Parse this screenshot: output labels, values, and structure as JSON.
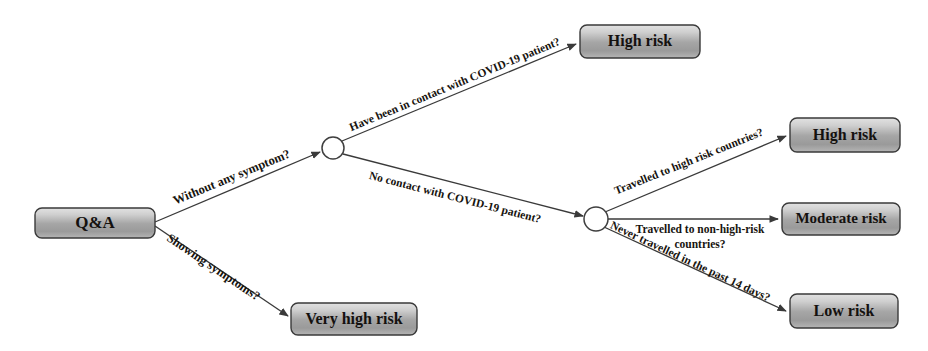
{
  "diagram": {
    "type": "decision-tree",
    "colors": {
      "box_fill_light": "#dcdcdc",
      "box_fill_mid": "#a9a9a9",
      "box_fill_dark": "#8f8f8f",
      "box_stroke": "#3a3a3a",
      "edge_stroke": "#3a3a3a",
      "text": "#14110f",
      "circle_fill": "#ffffff",
      "background": "#ffffff"
    },
    "nodes": [
      {
        "id": "root",
        "kind": "box",
        "label": "Q&A",
        "x": 35,
        "y": 208,
        "w": 120,
        "h": 30,
        "font_size": 17
      },
      {
        "id": "decision1",
        "kind": "circle",
        "label": "",
        "cx": 333,
        "cy": 148,
        "r": 11
      },
      {
        "id": "decision2",
        "kind": "circle",
        "label": "",
        "cx": 596,
        "cy": 219,
        "r": 12
      },
      {
        "id": "high-risk-contact",
        "kind": "box",
        "label": "High risk",
        "x": 580,
        "y": 25,
        "w": 120,
        "h": 33,
        "font_size": 16
      },
      {
        "id": "very-high-risk",
        "kind": "box",
        "label": "Very high risk",
        "x": 291,
        "y": 303,
        "w": 126,
        "h": 32,
        "font_size": 16
      },
      {
        "id": "high-risk-travel",
        "kind": "box",
        "label": "High risk",
        "x": 790,
        "y": 118,
        "w": 110,
        "h": 34,
        "font_size": 16
      },
      {
        "id": "moderate-risk",
        "kind": "box",
        "label": "Moderate risk",
        "x": 782,
        "y": 203,
        "w": 118,
        "h": 32,
        "font_size": 15
      },
      {
        "id": "low-risk",
        "kind": "box",
        "label": "Low risk",
        "x": 790,
        "y": 294,
        "w": 108,
        "h": 34,
        "font_size": 16
      }
    ],
    "edges": [
      {
        "id": "edge-without-symptom",
        "from": "root",
        "to": "decision1",
        "label": "Without any symptom?",
        "x1": 155,
        "y1": 222,
        "x2": 320,
        "y2": 152,
        "label_x": 232,
        "label_y": 178,
        "label_rotate": -22.5,
        "font_size": 12.5,
        "arrow": true
      },
      {
        "id": "edge-showing-symptoms",
        "from": "root",
        "to": "very-high-risk",
        "label": "Showing symptoms?",
        "x1": 155,
        "y1": 226,
        "x2": 288,
        "y2": 316,
        "label_x": 213,
        "label_y": 268,
        "label_rotate": 34,
        "font_size": 12.5,
        "arrow": true
      },
      {
        "id": "edge-contact-covid",
        "from": "decision1",
        "to": "high-risk-contact",
        "label": "Have been in contact with COVID-19 patient?",
        "x1": 342,
        "y1": 141,
        "x2": 576,
        "y2": 44,
        "label_x": 455,
        "label_y": 85,
        "label_rotate": -22.5,
        "font_size": 11.5,
        "arrow": true
      },
      {
        "id": "edge-no-contact-covid",
        "from": "decision1",
        "to": "decision2",
        "label": "No contact with COVID-19 patient?",
        "x1": 343,
        "y1": 154,
        "x2": 583,
        "y2": 216,
        "label_x": 455,
        "label_y": 198,
        "label_rotate": 14.5,
        "font_size": 11.5,
        "arrow": true
      },
      {
        "id": "edge-travelled-high-risk",
        "from": "decision2",
        "to": "high-risk-travel",
        "label": "Travelled to high risk countries?",
        "x1": 605,
        "y1": 212,
        "x2": 786,
        "y2": 136,
        "label_x": 689,
        "label_y": 162,
        "label_rotate": -22,
        "font_size": 11.5,
        "arrow": true
      },
      {
        "id": "edge-travelled-non-high-risk",
        "from": "decision2",
        "to": "moderate-risk",
        "label": "Travelled to non-high-risk\ncountries?",
        "label_line1": "Travelled to non-high-risk",
        "label_line2": "countries?",
        "x1": 608,
        "y1": 219,
        "x2": 778,
        "y2": 219,
        "label_x": 700,
        "label_y": 230,
        "label_rotate": 0,
        "font_size": 11.5,
        "arrow": true
      },
      {
        "id": "edge-never-travelled",
        "from": "decision2",
        "to": "low-risk",
        "label": "Never travelled in the past 14 days?",
        "x1": 604,
        "y1": 227,
        "x2": 786,
        "y2": 311,
        "label_x": 690,
        "label_y": 262,
        "label_rotate": 25,
        "font_size": 11.5,
        "arrow": true
      }
    ]
  }
}
